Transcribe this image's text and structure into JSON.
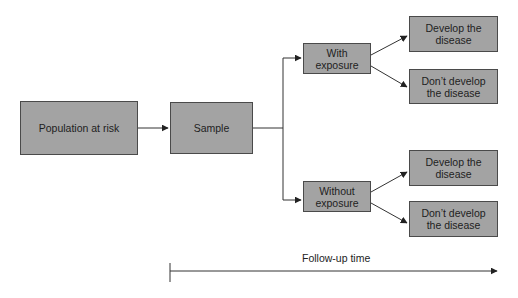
{
  "diagram": {
    "nodes": {
      "population": "Population at risk",
      "sample": "Sample",
      "with_exposure": "With exposure",
      "without_exposure": "Without exposure",
      "with_develop": "Develop the disease",
      "with_not_develop": "Don’t develop the disease",
      "without_develop": "Develop the disease",
      "without_not_develop": "Don’t develop the disease"
    },
    "timeline_label": "Follow-up time",
    "colors": {
      "box_fill": "#a3a3a3",
      "box_border": "#4a4a4a",
      "line": "#333333"
    }
  }
}
